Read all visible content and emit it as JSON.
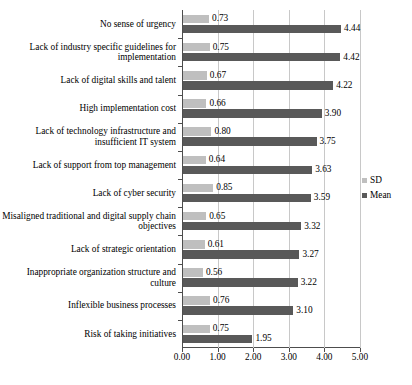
{
  "chart_data": {
    "type": "bar",
    "orientation": "horizontal",
    "title": "",
    "xlabel": "",
    "ylabel": "",
    "xlim": [
      0,
      5
    ],
    "xticks": [
      "0.00",
      "1.00",
      "2.00",
      "3.00",
      "4.00",
      "5.00"
    ],
    "xtick_values": [
      0,
      1,
      2,
      3,
      4,
      5
    ],
    "grid": true,
    "legend_position": "right",
    "categories": [
      "No sense of urgency",
      "Lack of industry specific guidelines for implementation",
      "Lack of digital skills and talent",
      "High implementation cost",
      "Lack of technology infrastructure and insufficient IT system",
      "Lack of support from top management",
      "Lack of cyber security",
      "Misaligned traditional and digital supply chain objectives",
      "Lack of strategic orientation",
      "Inappropriate organization structure and culture",
      "Inflexible business processes",
      "Risk of taking initiatives"
    ],
    "series": [
      {
        "name": "SD",
        "color": "#bfbfbf",
        "values": [
          0.73,
          0.75,
          0.67,
          0.66,
          0.8,
          0.64,
          0.85,
          0.65,
          0.61,
          0.56,
          0.76,
          0.75
        ],
        "labels": [
          "0.73",
          "0.75",
          "0.67",
          "0.66",
          "0.80",
          "0.64",
          "0.85",
          "0.65",
          "0.61",
          "0.56",
          "0.76",
          "0.75"
        ]
      },
      {
        "name": "Mean",
        "color": "#595959",
        "values": [
          4.44,
          4.42,
          4.22,
          3.9,
          3.75,
          3.63,
          3.59,
          3.32,
          3.27,
          3.22,
          3.1,
          1.95
        ],
        "labels": [
          "4.44",
          "4.42",
          "4.22",
          "3.90",
          "3.75",
          "3.63",
          "3.59",
          "3.32",
          "3.27",
          "3.22",
          "3.10",
          "1.95"
        ]
      }
    ]
  },
  "legend": {
    "items": [
      {
        "label": "SD",
        "color": "#bfbfbf"
      },
      {
        "label": "Mean",
        "color": "#595959"
      }
    ]
  }
}
